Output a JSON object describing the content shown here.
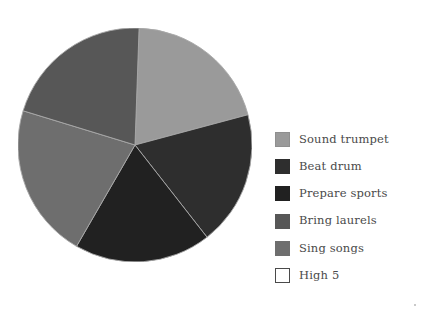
{
  "chart_data": {
    "type": "pie",
    "title": "",
    "subtitle": "",
    "xlabel": "",
    "ylabel": "",
    "grid": false,
    "legend_position": "right",
    "start_angle_deg": -88,
    "direction": "clockwise",
    "center": {
      "x": 117,
      "y": 117
    },
    "radius": 117,
    "labels": [
      "Sound trumpet",
      "Beat drum",
      "Prepare sports",
      "Bring laurels",
      "Sing songs",
      "High 5"
    ],
    "values": [
      73,
      67,
      68,
      75,
      77,
      0
    ],
    "unit": "degrees",
    "percentages": [
      20.3,
      18.6,
      18.9,
      20.8,
      21.4,
      0.0
    ],
    "colors": [
      "#9a9a9a",
      "#2e2e2e",
      "#212121",
      "#575757",
      "#6e6e6e",
      "#ffffff"
    ],
    "slice_edge_color": "#a8a8a8",
    "slices": [
      {
        "label": "Sound trumpet",
        "sweep_deg": 73,
        "percent": 20.3,
        "color": "#9a9a9a",
        "start_deg": -88,
        "end_deg": -15
      },
      {
        "label": "Beat drum",
        "sweep_deg": 67,
        "percent": 18.6,
        "color": "#2e2e2e",
        "start_deg": -15,
        "end_deg": 52
      },
      {
        "label": "Prepare sports",
        "sweep_deg": 68,
        "percent": 18.9,
        "color": "#212121",
        "start_deg": 52,
        "end_deg": 120
      },
      {
        "label": "Sing songs",
        "sweep_deg": 77,
        "percent": 21.4,
        "color": "#6e6e6e",
        "start_deg": 120,
        "end_deg": 197
      },
      {
        "label": "Bring laurels",
        "sweep_deg": 75,
        "percent": 20.8,
        "color": "#575757",
        "start_deg": 197,
        "end_deg": 272
      },
      {
        "label": "High 5",
        "sweep_deg": 0,
        "percent": 0.0,
        "color": "#ffffff",
        "start_deg": 272,
        "end_deg": 272
      }
    ]
  },
  "legend": {
    "items": [
      {
        "label": "Sound trumpet",
        "color": "#9a9a9a",
        "border": "#8f8f8f"
      },
      {
        "label": "Beat drum",
        "color": "#2e2e2e",
        "border": "#2e2e2e"
      },
      {
        "label": "Prepare sports",
        "color": "#212121",
        "border": "#212121"
      },
      {
        "label": "Bring laurels",
        "color": "#575757",
        "border": "#575757"
      },
      {
        "label": "Sing songs",
        "color": "#6e6e6e",
        "border": "#6e6e6e"
      },
      {
        "label": "High 5",
        "color": "#ffffff",
        "border": "#4a4a4a"
      }
    ]
  },
  "canvas": {
    "background": "#ffffff",
    "text_color": "#4a4a4a"
  }
}
